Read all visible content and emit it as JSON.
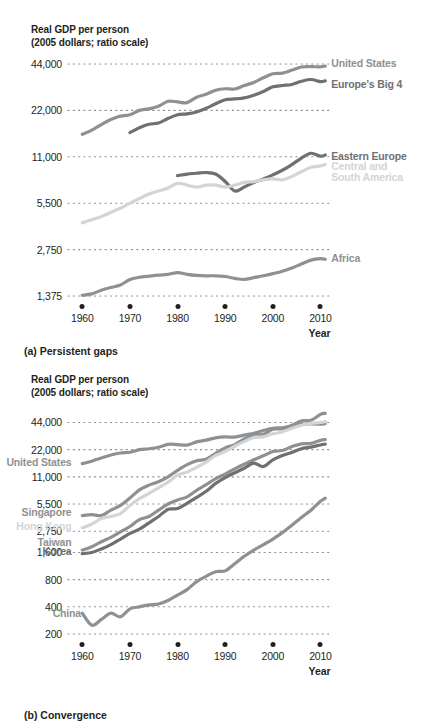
{
  "figure": {
    "axis_title": "Real GDP per person\n(2005 dollars; ratio scale)",
    "xlabel": "Year",
    "caption_a": "(a) Persistent gaps",
    "caption_b": "(b) Convergence"
  },
  "colors": {
    "ink": "#231f20",
    "grid": "#8c8c8c",
    "dark_gray": "#6e7072",
    "mid_gray": "#8e9193",
    "light_gray": "#b9bcbe",
    "pale_gray": "#d2d5d7",
    "background": "#ffffff"
  },
  "chart_data": [
    {
      "type": "line",
      "title": "(a) Persistent gaps",
      "ylabel": "Real GDP per person (2005 dollars; ratio scale)",
      "xlabel": "Year",
      "grid": true,
      "legend": "inline-right",
      "xlim": [
        1957,
        2012
      ],
      "ylim": [
        1375,
        44000
      ],
      "yscale": "log2",
      "yticks": [
        44000,
        22000,
        11000,
        5500,
        2750,
        1375
      ],
      "ytick_labels": [
        "44,000",
        "22,000",
        "11,000",
        "5,500",
        "2,750",
        "1,375"
      ],
      "xticks": [
        1960,
        1970,
        1980,
        1990,
        2000,
        2010
      ],
      "xtick_labels": [
        "1960",
        "1970",
        "1980",
        "1990",
        "2000",
        "2010"
      ],
      "series": [
        {
          "name": "United States",
          "color": "#8e9193",
          "label_x": 2011,
          "label_y": 44000,
          "x": [
            1960,
            1962,
            1964,
            1966,
            1968,
            1970,
            1972,
            1974,
            1976,
            1978,
            1980,
            1982,
            1984,
            1986,
            1988,
            1990,
            1992,
            1994,
            1996,
            1998,
            2000,
            2002,
            2004,
            2006,
            2008,
            2010,
            2011
          ],
          "y": [
            15400,
            16400,
            17800,
            19200,
            20200,
            20600,
            22000,
            22500,
            23400,
            25200,
            25000,
            24700,
            26800,
            28000,
            29700,
            30400,
            30300,
            31900,
            33400,
            35800,
            38000,
            38400,
            40200,
            42100,
            42300,
            42200,
            42600
          ]
        },
        {
          "name": "Europe's Big 4",
          "color": "#6e7072",
          "label_x": 2011,
          "label_y": 32000,
          "x": [
            1970,
            1972,
            1974,
            1976,
            1978,
            1980,
            1982,
            1984,
            1986,
            1988,
            1990,
            1992,
            1994,
            1996,
            1998,
            2000,
            2002,
            2004,
            2006,
            2008,
            2010,
            2011
          ],
          "y": [
            15800,
            17000,
            17900,
            18200,
            19500,
            20600,
            20900,
            21500,
            22700,
            24300,
            25800,
            26100,
            26500,
            27600,
            29200,
            31300,
            31900,
            32400,
            34000,
            34900,
            33800,
            34200
          ]
        },
        {
          "name": "Eastern Europe",
          "color": "#6e7072",
          "label_x": 2011,
          "label_y": 11000,
          "x": [
            1980,
            1982,
            1984,
            1986,
            1988,
            1990,
            1992,
            1994,
            1996,
            1998,
            2000,
            2002,
            2004,
            2006,
            2008,
            2010,
            2011
          ],
          "y": [
            8300,
            8500,
            8600,
            8700,
            8500,
            7600,
            6600,
            7000,
            7500,
            7900,
            8400,
            9000,
            9800,
            10800,
            11600,
            11100,
            11300
          ]
        },
        {
          "name": "Central and\nSouth America",
          "color": "#d2d5d7",
          "label_x": 2011,
          "label_y": 9500,
          "x": [
            1960,
            1962,
            1964,
            1966,
            1968,
            1970,
            1972,
            1974,
            1976,
            1978,
            1980,
            1982,
            1984,
            1986,
            1988,
            1990,
            1992,
            1994,
            1996,
            1998,
            2000,
            2002,
            2004,
            2006,
            2008,
            2010,
            2011
          ],
          "y": [
            4100,
            4300,
            4500,
            4800,
            5100,
            5500,
            5900,
            6300,
            6600,
            6900,
            7400,
            7200,
            7000,
            7200,
            7200,
            7000,
            7200,
            7500,
            7600,
            7800,
            7900,
            7800,
            8200,
            8800,
            9400,
            9600,
            9800
          ]
        },
        {
          "name": "Africa",
          "color": "#8e9193",
          "label_x": 2011,
          "label_y": 2400,
          "x": [
            1960,
            1962,
            1964,
            1966,
            1968,
            1970,
            1972,
            1974,
            1976,
            1978,
            1980,
            1982,
            1984,
            1986,
            1988,
            1990,
            1992,
            1994,
            1996,
            1998,
            2000,
            2002,
            2004,
            2006,
            2008,
            2010,
            2011
          ],
          "y": [
            1390,
            1420,
            1500,
            1560,
            1620,
            1760,
            1820,
            1850,
            1880,
            1900,
            1950,
            1900,
            1870,
            1860,
            1860,
            1840,
            1790,
            1760,
            1810,
            1860,
            1920,
            1990,
            2090,
            2220,
            2350,
            2400,
            2380
          ]
        }
      ]
    },
    {
      "type": "line",
      "title": "(b) Convergence",
      "ylabel": "Real GDP per person (2005 dollars; ratio scale)",
      "xlabel": "Year",
      "grid": true,
      "legend": "inline-left",
      "xlim": [
        1957,
        2012
      ],
      "ylim": [
        200,
        56000
      ],
      "yscale": "log2",
      "yticks": [
        44000,
        22000,
        11000,
        5500,
        2750,
        1600,
        800,
        400,
        200
      ],
      "ytick_labels": [
        "44,000",
        "22,000",
        "11,000",
        "5,500",
        "2,750",
        "1,600",
        "800",
        "400",
        "200"
      ],
      "xticks": [
        1960,
        1970,
        1980,
        1990,
        2000,
        2010
      ],
      "xtick_labels": [
        "1960",
        "1970",
        "1980",
        "1990",
        "2000",
        "2010"
      ],
      "series": [
        {
          "name": "United States",
          "color": "#8e9193",
          "label_x": 1959,
          "label_y": 15500,
          "x": [
            1960,
            1962,
            1964,
            1966,
            1968,
            1970,
            1972,
            1974,
            1976,
            1978,
            1980,
            1982,
            1984,
            1986,
            1988,
            1990,
            1992,
            1994,
            1996,
            1998,
            2000,
            2002,
            2004,
            2006,
            2008,
            2010,
            2011
          ],
          "y": [
            15400,
            16400,
            17800,
            19200,
            20200,
            20600,
            22000,
            22500,
            23400,
            25200,
            25000,
            24700,
            26800,
            28000,
            29700,
            30400,
            30300,
            31900,
            33400,
            35800,
            38000,
            38400,
            40200,
            42100,
            42300,
            42200,
            42600
          ]
        },
        {
          "name": "Singapore",
          "color": "#8e9193",
          "label_x": 1959,
          "label_y": 4400,
          "x": [
            1960,
            1962,
            1964,
            1966,
            1968,
            1970,
            1972,
            1974,
            1976,
            1978,
            1980,
            1982,
            1984,
            1986,
            1988,
            1990,
            1992,
            1994,
            1996,
            1998,
            2000,
            2002,
            2004,
            2006,
            2008,
            2010,
            2011
          ],
          "y": [
            4100,
            4200,
            4100,
            4700,
            5300,
            6400,
            7900,
            8900,
            9700,
            11000,
            13000,
            15000,
            16600,
            17200,
            20000,
            23000,
            25000,
            29000,
            32000,
            32500,
            37000,
            37500,
            41000,
            46000,
            46500,
            54000,
            55500
          ]
        },
        {
          "name": "Hong Kong",
          "color": "#d2d5d7",
          "label_x": 1959,
          "label_y": 3100,
          "x": [
            1960,
            1962,
            1964,
            1966,
            1968,
            1970,
            1972,
            1974,
            1976,
            1978,
            1980,
            1982,
            1984,
            1986,
            1988,
            1990,
            1992,
            1994,
            1996,
            1998,
            2000,
            2002,
            2004,
            2006,
            2008,
            2010,
            2011
          ],
          "y": [
            3000,
            3300,
            3800,
            4000,
            4300,
            5300,
            6300,
            7200,
            8300,
            9600,
            11500,
            12400,
            14000,
            16000,
            19000,
            21000,
            24000,
            27000,
            30000,
            30500,
            33000,
            34500,
            38000,
            41000,
            43000,
            44000,
            45000
          ]
        },
        {
          "name": "Taiwan",
          "color": "#8e9193",
          "label_x": 1959,
          "label_y": 2050,
          "x": [
            1960,
            1962,
            1964,
            1966,
            1968,
            1970,
            1972,
            1974,
            1976,
            1978,
            1980,
            1982,
            1984,
            1986,
            1988,
            1990,
            1992,
            1994,
            1996,
            1998,
            2000,
            2002,
            2004,
            2006,
            2008,
            2010,
            2011
          ],
          "y": [
            1700,
            1850,
            2100,
            2350,
            2700,
            3100,
            3700,
            4000,
            4700,
            5500,
            6100,
            6600,
            7800,
            9000,
            10500,
            11800,
            13500,
            15200,
            17000,
            18800,
            21000,
            21500,
            23800,
            25500,
            25800,
            28000,
            28500
          ]
        },
        {
          "name": "Korea",
          "color": "#6e7072",
          "label_x": 1959,
          "label_y": 1600,
          "x": [
            1960,
            1962,
            1964,
            1966,
            1968,
            1970,
            1972,
            1974,
            1976,
            1978,
            1980,
            1982,
            1984,
            1986,
            1988,
            1990,
            1992,
            1994,
            1996,
            1998,
            2000,
            2002,
            2004,
            2006,
            2008,
            2010,
            2011
          ],
          "y": [
            1550,
            1600,
            1750,
            1950,
            2250,
            2600,
            2900,
            3400,
            4000,
            4800,
            4900,
            5600,
            6500,
            7600,
            9300,
            10800,
            12200,
            13700,
            15600,
            14300,
            17000,
            19000,
            20500,
            22500,
            23500,
            24800,
            25300
          ]
        },
        {
          "name": "China",
          "color": "#8e9193",
          "label_x": 1961,
          "label_y": 330,
          "x": [
            1960,
            1962,
            1964,
            1966,
            1968,
            1970,
            1972,
            1974,
            1976,
            1978,
            1980,
            1982,
            1984,
            1986,
            1988,
            1990,
            1992,
            1994,
            1996,
            1998,
            2000,
            2002,
            2004,
            2006,
            2008,
            2010,
            2011
          ],
          "y": [
            340,
            250,
            290,
            340,
            310,
            380,
            400,
            420,
            430,
            470,
            540,
            620,
            760,
            870,
            980,
            1000,
            1200,
            1450,
            1700,
            1950,
            2250,
            2650,
            3200,
            3900,
            4700,
            5900,
            6400
          ]
        }
      ]
    }
  ]
}
